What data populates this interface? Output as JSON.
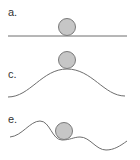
{
  "diagram": {
    "colors": {
      "line": "#6e6e6e",
      "ball_fill": "#c6c6c6",
      "ball_stroke": "#7a7a7a",
      "label": "#333333"
    },
    "panels": [
      {
        "label": "a.",
        "surface": "flat",
        "ball": {
          "cx": 67,
          "cy": 27,
          "r": 8
        }
      },
      {
        "label": "c.",
        "surface": "hill",
        "ball": {
          "cx": 67,
          "cy": 60,
          "r": 8
        }
      },
      {
        "label": "e.",
        "surface": "wavy",
        "ball": {
          "cx": 64,
          "cy": 131,
          "r": 8
        }
      }
    ]
  }
}
